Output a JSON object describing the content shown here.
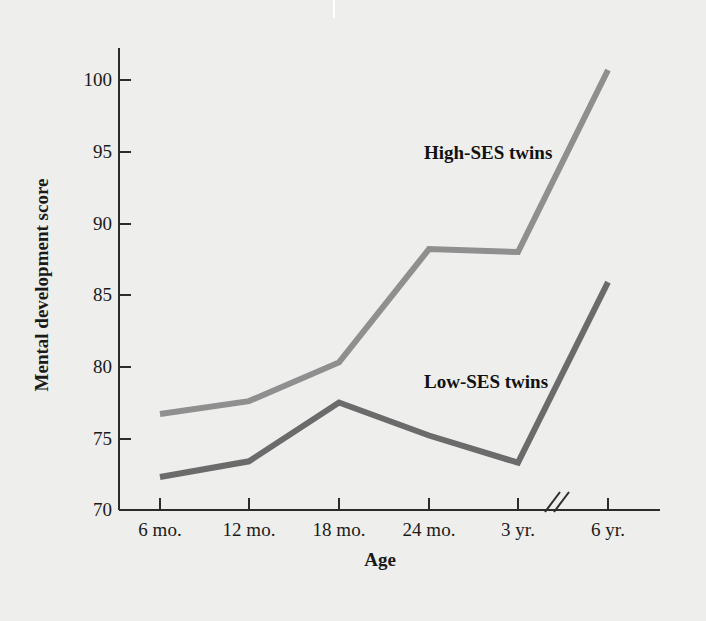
{
  "figure": {
    "background_color": "#eeeeec",
    "axis_color": "#2b2b2b"
  },
  "chart_data": {
    "type": "line",
    "title": "",
    "xlabel": "Age",
    "ylabel": "Mental development score",
    "categories": [
      "6 mo.",
      "12 mo.",
      "18 mo.",
      "24 mo.",
      "3 yr.",
      "6 yr."
    ],
    "ylim": [
      70,
      102
    ],
    "yticks": [
      70,
      75,
      80,
      85,
      90,
      95,
      100
    ],
    "ytick_labels": [
      "70",
      "75",
      "80",
      "85",
      "90",
      "95",
      "100"
    ],
    "grid": false,
    "legend_position": "inline-annotations",
    "axis_break": {
      "present": true,
      "between": [
        "3 yr.",
        "6 yr."
      ],
      "symbol": "//"
    },
    "series": [
      {
        "name": "High-SES twins",
        "color": "#8f8f8f",
        "values": [
          76.7,
          77.6,
          80.3,
          88.2,
          88.0,
          100.7
        ]
      },
      {
        "name": "Low-SES twins",
        "color": "#6b6b6b",
        "values": [
          72.3,
          73.4,
          77.5,
          75.2,
          73.3,
          85.9
        ]
      }
    ],
    "annotations": [
      {
        "text": "High-SES twins",
        "series": "High-SES twins"
      },
      {
        "text": "Low-SES twins",
        "series": "Low-SES twins"
      }
    ]
  }
}
